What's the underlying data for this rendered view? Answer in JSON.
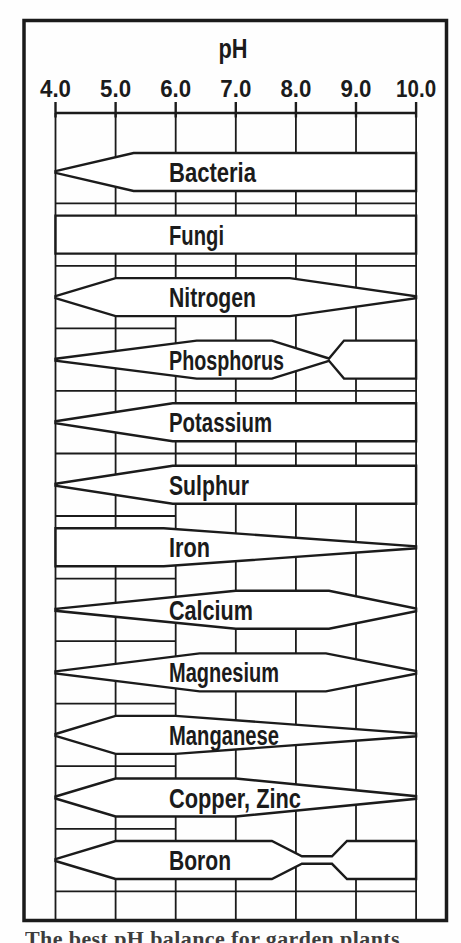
{
  "figure": {
    "title": "pH",
    "caption_fragment": "The best pH balance for garden plants"
  },
  "chart_data": {
    "type": "area",
    "title": "pH",
    "xlabel": "pH",
    "ylabel": "relative availability (band width)",
    "x_range": [
      4.0,
      10.0
    ],
    "x_ticks": [
      "4.0",
      "5.0",
      "6.0",
      "7.0",
      "8.0",
      "9.0",
      "10.0"
    ],
    "x_tick_values": [
      4,
      5,
      6,
      7,
      8,
      9,
      10
    ],
    "grid": true,
    "legend": "none",
    "colors": {
      "line": "#1b1b1b",
      "band_fill": "#ffffff",
      "background": "#fefefe"
    },
    "bands": [
      {
        "label": "Bacteria",
        "profile": [
          [
            4.0,
            0.05
          ],
          [
            5.3,
            1
          ],
          [
            10.0,
            1
          ]
        ]
      },
      {
        "label": "Fungi",
        "profile": [
          [
            4.0,
            1
          ],
          [
            10.0,
            1
          ]
        ]
      },
      {
        "label": "Nitrogen",
        "profile": [
          [
            4.0,
            0.05
          ],
          [
            5.0,
            1
          ],
          [
            7.9,
            1
          ],
          [
            10.0,
            0.05
          ]
        ]
      },
      {
        "label": "Phosphorus",
        "profile": [
          [
            4.0,
            0.05
          ],
          [
            6.35,
            1
          ],
          [
            7.6,
            1
          ],
          [
            8.55,
            0.06
          ],
          [
            8.8,
            1
          ],
          [
            10.0,
            1
          ]
        ]
      },
      {
        "label": "Potassium",
        "profile": [
          [
            4.0,
            0.05
          ],
          [
            5.95,
            1
          ],
          [
            10.0,
            1
          ]
        ]
      },
      {
        "label": "Sulphur",
        "profile": [
          [
            4.0,
            0.05
          ],
          [
            5.95,
            1
          ],
          [
            10.0,
            1
          ]
        ]
      },
      {
        "label": "Iron",
        "profile": [
          [
            4.0,
            1
          ],
          [
            5.8,
            1
          ],
          [
            10.0,
            0.05
          ]
        ]
      },
      {
        "label": "Calcium",
        "profile": [
          [
            4.0,
            0.05
          ],
          [
            7.0,
            1
          ],
          [
            8.55,
            1
          ],
          [
            10.0,
            0.07
          ]
        ]
      },
      {
        "label": "Magnesium",
        "profile": [
          [
            4.0,
            0.05
          ],
          [
            6.4,
            1
          ],
          [
            8.5,
            1
          ],
          [
            10.0,
            0.07
          ]
        ]
      },
      {
        "label": "Manganese",
        "profile": [
          [
            4.0,
            0.05
          ],
          [
            5.0,
            1
          ],
          [
            6.0,
            1
          ],
          [
            10.0,
            0.07
          ]
        ]
      },
      {
        "label": "Copper, Zinc",
        "profile": [
          [
            4.0,
            0.05
          ],
          [
            5.0,
            1
          ],
          [
            7.0,
            1
          ],
          [
            10.0,
            0.07
          ]
        ]
      },
      {
        "label": "Boron",
        "profile": [
          [
            4.0,
            0.05
          ],
          [
            5.0,
            1
          ],
          [
            7.6,
            1
          ],
          [
            8.1,
            0.2
          ],
          [
            8.6,
            0.2
          ],
          [
            8.85,
            1
          ],
          [
            10.0,
            1
          ]
        ]
      }
    ]
  }
}
